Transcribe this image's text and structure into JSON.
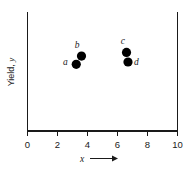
{
  "chart_data": {
    "type": "scatter",
    "title": "",
    "xlabel": "x",
    "ylabel": "Yield, y",
    "ylabel_prefix": "Yield, ",
    "ylabel_symbol": "y",
    "xlabel_arrow": "→",
    "xlim": [
      0,
      10
    ],
    "ylim": [
      0,
      1
    ],
    "xticks": [
      0,
      2,
      4,
      6,
      8,
      10
    ],
    "xticklabels": [
      "0",
      "2",
      "4",
      "6",
      "8",
      "10"
    ],
    "yticks": [],
    "yticklabels": [],
    "grid": false,
    "legend": false,
    "series": [
      {
        "name": "observations",
        "point_labels": [
          "a",
          "b",
          "c",
          "d"
        ],
        "x": [
          3.25,
          3.6,
          6.6,
          6.7
        ],
        "y": [
          0.56,
          0.63,
          0.66,
          0.58
        ],
        "marker": "filled-circle",
        "marker_color": "#000000",
        "marker_size": 4.6
      }
    ],
    "label_offsets": [
      {
        "label": "a",
        "dx": -8.5,
        "dy": 1.0
      },
      {
        "label": "b",
        "dx": -2.0,
        "dy": -8.0
      },
      {
        "label": "c",
        "dx": -1.5,
        "dy": -8.5
      },
      {
        "label": "d",
        "dx": 6.0,
        "dy": 3.5
      }
    ],
    "axes": {
      "left_spine": true,
      "right_spine": true,
      "bottom_spine": true,
      "top_spine": false,
      "tick_direction": "out"
    },
    "colors": {
      "foreground": "#1a1a1a",
      "marker": "#000000",
      "background": "#ffffff"
    }
  }
}
